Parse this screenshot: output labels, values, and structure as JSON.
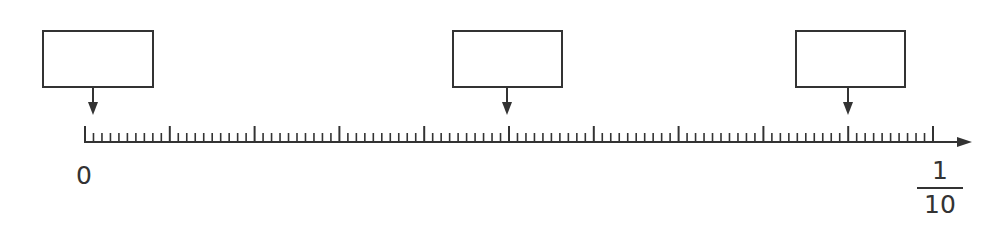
{
  "diagram": {
    "type": "number-line",
    "colors": {
      "stroke": "#333333",
      "background": "#ffffff"
    },
    "axis": {
      "start_value": 0,
      "end_value": "1/10",
      "major_divisions": 10,
      "minor_per_major": 10,
      "has_arrow": true
    },
    "labels": {
      "start": "0",
      "end_numerator": "1",
      "end_denominator": "10"
    },
    "answer_boxes": [
      {
        "id": "box-1",
        "points_to_tick": 1,
        "value": ""
      },
      {
        "id": "box-2",
        "points_to_tick": 50,
        "value": ""
      },
      {
        "id": "box-3",
        "points_to_tick": 90,
        "value": ""
      }
    ]
  }
}
